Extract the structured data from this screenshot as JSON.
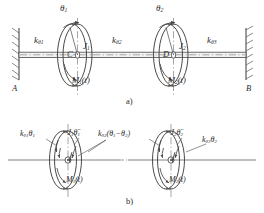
{
  "figure": {
    "title_internal": "Torsional two-disk shaft system",
    "panels": [
      {
        "id": "a",
        "label": "a)"
      },
      {
        "id": "b",
        "label": "b)"
      }
    ]
  },
  "panel_a": {
    "wall_left_label": "A",
    "wall_right_label": "B",
    "angles": [
      {
        "name": "theta-1",
        "text": "θ",
        "sub": "1"
      },
      {
        "name": "theta-2",
        "text": "θ",
        "sub": "2"
      }
    ],
    "springs": [
      {
        "name": "k-theta-1",
        "k": "k",
        "ksub": "θ1"
      },
      {
        "name": "k-theta-2",
        "k": "k",
        "ksub": "θ2"
      },
      {
        "name": "k-theta-3",
        "k": "k",
        "ksub": "θ3"
      }
    ],
    "disks": [
      {
        "name": "disk-1",
        "inertia": "J",
        "inertia_sub": "1",
        "center": "C",
        "torque": "M",
        "torque_sub": "1",
        "torque_arg": "(t)"
      },
      {
        "name": "disk-2",
        "inertia": "J",
        "inertia_sub": "2",
        "center": "D",
        "torque": "M",
        "torque_sub": "2",
        "torque_arg": "(t)"
      }
    ]
  },
  "panel_b": {
    "disk_1": {
      "spring_left": "k",
      "spring_left_sub": "θ1",
      "spring_left_var": "θ",
      "spring_left_var_sub": "1",
      "inertia_term": "−J",
      "inertia_term_sub": "1",
      "inertia_term_var": "θ̈",
      "inertia_term_var_sub": "1",
      "coupling": "k",
      "coupling_sub": "θ2",
      "coupling_expr_open": "(θ",
      "coupling_expr_s1": "1",
      "coupling_expr_minus": "−θ",
      "coupling_expr_s2": "2",
      "coupling_expr_close": ")",
      "torque": "M",
      "torque_sub": "1",
      "torque_arg": "(t)"
    },
    "disk_2": {
      "inertia_term": "−J",
      "inertia_term_sub": "2",
      "inertia_term_var": "θ̈",
      "inertia_term_var_sub": "2",
      "spring_right": "k",
      "spring_right_sub": "θ3",
      "spring_right_var": "θ",
      "spring_right_var_sub": "2",
      "torque": "M",
      "torque_sub": "2",
      "torque_arg": "(t)"
    }
  },
  "colors": {
    "line": "#4a4a4a",
    "line_dark": "#333333",
    "hatch": "#5a5a5a",
    "text": "#2b2b2b",
    "shaft_fill": "#f2f2f2",
    "disk_fill": "#ffffff",
    "centerline": "#5c5c5c"
  }
}
